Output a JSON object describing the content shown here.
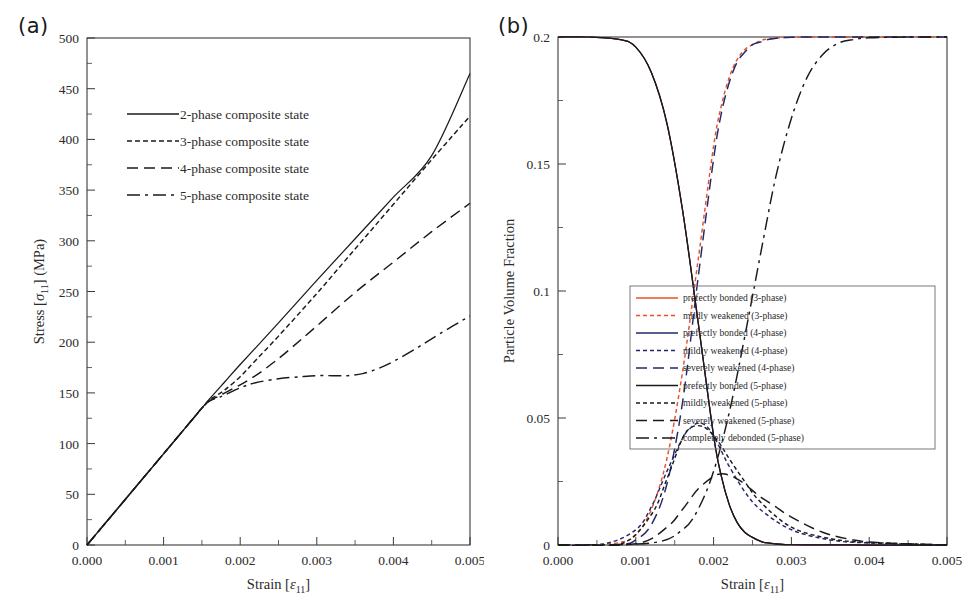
{
  "figure": {
    "panel_a_label": "(a)",
    "panel_b_label": "(b)"
  },
  "chart_data": [
    {
      "id": "panel-a",
      "type": "line",
      "title": "",
      "xlabel_main": "Strain [",
      "xlabel_sym": "ε",
      "xlabel_sub": "11",
      "xlabel_end": "]",
      "ylabel_main": "Stress [",
      "ylabel_sym": "σ",
      "ylabel_sub": "11",
      "ylabel_end": "] (MPa)",
      "xlim": [
        0,
        0.005
      ],
      "ylim": [
        0,
        500
      ],
      "xticks": [
        0,
        0.001,
        0.002,
        0.003,
        0.004,
        0.005
      ],
      "xticklabels": [
        "0.000",
        "0.001",
        "0.002",
        "0.003",
        "0.004",
        "0.005"
      ],
      "yticks": [
        0,
        50,
        100,
        150,
        200,
        250,
        300,
        350,
        400,
        450,
        500
      ],
      "yticklabels": [
        "0",
        "50",
        "100",
        "150",
        "200",
        "250",
        "300",
        "350",
        "400",
        "450",
        "500"
      ],
      "grid": false,
      "legend_position": "upper-left-inside",
      "series": [
        {
          "name": "2-phase composite state",
          "color": "#1a1a1a",
          "dash": "none",
          "x": [
            0,
            0.0002,
            0.0004,
            0.0006,
            0.0008,
            0.001,
            0.0012,
            0.0014,
            0.0015,
            0.0016,
            0.0018,
            0.002,
            0.0025,
            0.003,
            0.0035,
            0.004,
            0.0045,
            0.005
          ],
          "y": [
            0,
            18,
            36,
            54,
            72,
            90,
            108,
            126,
            135,
            144,
            161,
            178,
            219,
            261,
            302,
            343,
            384,
            465
          ]
        },
        {
          "name": "3-phase composite state",
          "color": "#1a1a1a",
          "dash": "5,3",
          "x": [
            0,
            0.0002,
            0.0004,
            0.0006,
            0.0008,
            0.001,
            0.0012,
            0.0014,
            0.0015,
            0.0016,
            0.0017,
            0.0018,
            0.002,
            0.0022,
            0.0025,
            0.003,
            0.0035,
            0.004,
            0.0045,
            0.005
          ],
          "y": [
            0,
            18,
            36,
            54,
            72,
            90,
            108,
            126,
            135,
            143,
            148,
            153,
            166,
            182,
            206,
            248,
            292,
            336,
            380,
            423
          ]
        },
        {
          "name": "4-phase composite state",
          "color": "#1a1a1a",
          "dash": "11,6",
          "x": [
            0,
            0.0002,
            0.0004,
            0.0006,
            0.0008,
            0.001,
            0.0012,
            0.0014,
            0.0015,
            0.0016,
            0.0017,
            0.0018,
            0.002,
            0.0022,
            0.0024,
            0.0026,
            0.003,
            0.0035,
            0.004,
            0.0045,
            0.005
          ],
          "y": [
            0,
            18,
            36,
            54,
            72,
            90,
            108,
            126,
            135,
            142,
            146,
            150,
            158,
            167,
            178,
            190,
            216,
            249,
            279,
            309,
            337
          ]
        },
        {
          "name": "5-phase composite state",
          "color": "#1a1a1a",
          "dash": "13,5,3,5",
          "x": [
            0,
            0.0002,
            0.0004,
            0.0006,
            0.0008,
            0.001,
            0.0012,
            0.0014,
            0.0015,
            0.0016,
            0.0017,
            0.0018,
            0.002,
            0.0022,
            0.0025,
            0.0028,
            0.003,
            0.0032,
            0.0034,
            0.0036,
            0.0038,
            0.004,
            0.0043,
            0.0046,
            0.005
          ],
          "y": [
            0,
            18,
            36,
            54,
            72,
            90,
            108,
            126,
            135,
            142,
            145,
            148,
            155,
            160,
            164,
            166,
            167,
            167,
            167,
            169,
            174,
            181,
            194,
            208,
            226
          ]
        }
      ]
    },
    {
      "id": "panel-b",
      "type": "line",
      "title": "",
      "xlabel_main": "Strain [",
      "xlabel_sym": "ε",
      "xlabel_sub": "11",
      "xlabel_end": "]",
      "ylabel": "Particle Volume  Fraction",
      "xlim": [
        0,
        0.005
      ],
      "ylim": [
        0,
        0.2
      ],
      "xticks": [
        0,
        0.001,
        0.002,
        0.003,
        0.004,
        0.005
      ],
      "xticklabels": [
        "0.000",
        "0.001",
        "0.002",
        "0.003",
        "0.004",
        "0.005"
      ],
      "yticks": [
        0,
        0.05,
        0.1,
        0.15,
        0.2
      ],
      "yticklabels": [
        "0",
        "0.05",
        "0.1",
        "0.15",
        "0.2"
      ],
      "grid": false,
      "legend_position": "right-middle-inside",
      "series": [
        {
          "name": "prefectly bonded (3-phase)",
          "color": "#e8502a",
          "dash": "none",
          "x": [
            0,
            0.0004,
            0.0008,
            0.001,
            0.0012,
            0.0014,
            0.0016,
            0.0018,
            0.002,
            0.0021,
            0.0022,
            0.0023,
            0.0024,
            0.0025,
            0.0026,
            0.0027,
            0.003,
            0.004,
            0.005
          ],
          "y": [
            0.2,
            0.2,
            0.199,
            0.196,
            0.186,
            0.166,
            0.132,
            0.088,
            0.043,
            0.027,
            0.016,
            0.009,
            0.005,
            0.003,
            0.0015,
            0.0008,
            0.0001,
            0,
            0
          ]
        },
        {
          "name": "mildly weakened (3-phase)",
          "color": "#e8502a",
          "dash": "4,3",
          "x": [
            0,
            0.0004,
            0.0008,
            0.001,
            0.0012,
            0.0014,
            0.0016,
            0.0018,
            0.002,
            0.0021,
            0.0022,
            0.0023,
            0.0024,
            0.0025,
            0.0026,
            0.0027,
            0.003,
            0.004,
            0.005
          ],
          "y": [
            0,
            0,
            0.001,
            0.004,
            0.014,
            0.034,
            0.068,
            0.112,
            0.157,
            0.173,
            0.184,
            0.191,
            0.195,
            0.197,
            0.1985,
            0.1992,
            0.1999,
            0.2,
            0.2
          ]
        },
        {
          "name": "prefectly bonded (4-phase)",
          "color": "#23276b",
          "dash": "none",
          "x": [
            0,
            0.0004,
            0.0008,
            0.001,
            0.0012,
            0.0014,
            0.0016,
            0.0018,
            0.002,
            0.0021,
            0.0022,
            0.0023,
            0.0024,
            0.0025,
            0.0026,
            0.0027,
            0.003,
            0.004,
            0.005
          ],
          "y": [
            0.2,
            0.2,
            0.199,
            0.196,
            0.186,
            0.166,
            0.132,
            0.088,
            0.043,
            0.027,
            0.016,
            0.009,
            0.005,
            0.003,
            0.0015,
            0.0008,
            0.0001,
            0,
            0
          ]
        },
        {
          "name": "mildly weakened (4-phase)",
          "color": "#23276b",
          "dash": "4,3",
          "x": [
            0,
            0.0006,
            0.001,
            0.0012,
            0.0014,
            0.0016,
            0.0017,
            0.0018,
            0.0019,
            0.002,
            0.0021,
            0.0022,
            0.0024,
            0.0026,
            0.003,
            0.0035,
            0.004,
            0.005
          ],
          "y": [
            0,
            0.0005,
            0.006,
            0.015,
            0.029,
            0.042,
            0.046,
            0.048,
            0.047,
            0.043,
            0.037,
            0.031,
            0.021,
            0.014,
            0.006,
            0.002,
            0.0008,
            0
          ]
        },
        {
          "name": "severely weakened (4-phase)",
          "color": "#23276b",
          "dash": "11,6",
          "x": [
            0,
            0.0008,
            0.001,
            0.0012,
            0.0014,
            0.0016,
            0.0018,
            0.002,
            0.0021,
            0.0022,
            0.0023,
            0.0024,
            0.0025,
            0.0026,
            0.0027,
            0.003,
            0.004,
            0.005
          ],
          "y": [
            0,
            0.0002,
            0.002,
            0.008,
            0.024,
            0.056,
            0.105,
            0.152,
            0.17,
            0.182,
            0.19,
            0.194,
            0.197,
            0.198,
            0.199,
            0.1999,
            0.2,
            0.2
          ]
        },
        {
          "name": "prefectly bonded (5-phase)",
          "color": "#1a1a1a",
          "dash": "none",
          "x": [
            0,
            0.0004,
            0.0008,
            0.001,
            0.0012,
            0.0014,
            0.0016,
            0.0018,
            0.002,
            0.0021,
            0.0022,
            0.0023,
            0.0024,
            0.0025,
            0.0026,
            0.0027,
            0.003,
            0.004,
            0.005
          ],
          "y": [
            0.2,
            0.2,
            0.199,
            0.196,
            0.186,
            0.166,
            0.132,
            0.088,
            0.043,
            0.027,
            0.016,
            0.009,
            0.005,
            0.003,
            0.0015,
            0.0008,
            0.0001,
            0,
            0
          ]
        },
        {
          "name": "mildly weakened (5-phase)",
          "color": "#1a1a1a",
          "dash": "4,3",
          "x": [
            0,
            0.0008,
            0.0012,
            0.0014,
            0.0016,
            0.0017,
            0.0018,
            0.0019,
            0.002,
            0.0021,
            0.0022,
            0.0024,
            0.0026,
            0.003,
            0.0035,
            0.004,
            0.005
          ],
          "y": [
            0,
            0.0003,
            0.012,
            0.026,
            0.042,
            0.046,
            0.047,
            0.046,
            0.043,
            0.039,
            0.034,
            0.025,
            0.017,
            0.007,
            0.0025,
            0.001,
            0
          ]
        },
        {
          "name": "severely weakened (5-phase)",
          "color": "#1a1a1a",
          "dash": "11,6",
          "x": [
            0,
            0.001,
            0.0014,
            0.0016,
            0.0018,
            0.002,
            0.0021,
            0.0022,
            0.0023,
            0.0024,
            0.0026,
            0.0028,
            0.003,
            0.0034,
            0.0038,
            0.0042,
            0.005
          ],
          "y": [
            0,
            0.0005,
            0.007,
            0.014,
            0.022,
            0.027,
            0.028,
            0.0275,
            0.026,
            0.024,
            0.019,
            0.015,
            0.011,
            0.005,
            0.002,
            0.0008,
            0
          ]
        },
        {
          "name": "completely debonded (5-phase)",
          "color": "#1a1a1a",
          "dash": "13,5,3,5",
          "x": [
            0,
            0.0012,
            0.0016,
            0.0018,
            0.002,
            0.0022,
            0.0024,
            0.0026,
            0.0028,
            0.003,
            0.0032,
            0.0034,
            0.0036,
            0.0038,
            0.004,
            0.0045,
            0.005
          ],
          "y": [
            0,
            0.0008,
            0.006,
            0.014,
            0.029,
            0.052,
            0.082,
            0.114,
            0.145,
            0.168,
            0.184,
            0.193,
            0.1975,
            0.199,
            0.1997,
            0.2,
            0.2
          ]
        }
      ]
    }
  ],
  "legend_a": {
    "items": [
      {
        "label": "2-phase composite state",
        "color": "#1a1a1a",
        "dash": "none"
      },
      {
        "label": "3-phase composite state",
        "color": "#1a1a1a",
        "dash": "5,3"
      },
      {
        "label": "4-phase composite state",
        "color": "#1a1a1a",
        "dash": "11,6"
      },
      {
        "label": "5-phase composite state",
        "color": "#1a1a1a",
        "dash": "13,5,3,5"
      }
    ]
  },
  "legend_b": {
    "items": [
      {
        "label": "prefectly bonded (3-phase)",
        "color": "#e8502a",
        "dash": "none"
      },
      {
        "label": "mildly weakened (3-phase)",
        "color": "#e8502a",
        "dash": "4,3"
      },
      {
        "label": "prefectly bonded (4-phase)",
        "color": "#23276b",
        "dash": "none"
      },
      {
        "label": "mildly weakened (4-phase)",
        "color": "#23276b",
        "dash": "4,3"
      },
      {
        "label": "severely weakened (4-phase)",
        "color": "#23276b",
        "dash": "11,6"
      },
      {
        "label": "prefectly bonded (5-phase)",
        "color": "#1a1a1a",
        "dash": "none"
      },
      {
        "label": "mildly weakened (5-phase)",
        "color": "#1a1a1a",
        "dash": "4,3"
      },
      {
        "label": "severely weakened (5-phase)",
        "color": "#1a1a1a",
        "dash": "11,6"
      },
      {
        "label": "completely debonded (5-phase)",
        "color": "#1a1a1a",
        "dash": "13,5,3,5"
      }
    ]
  }
}
